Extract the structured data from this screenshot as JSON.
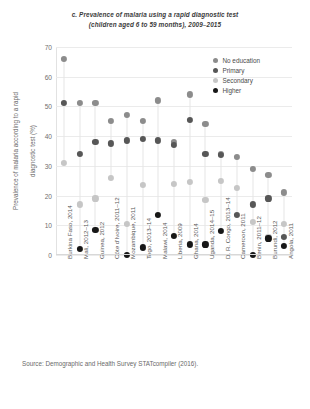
{
  "chart_data": {
    "type": "scatter",
    "title": "c. Prevalence of malaria using a rapid diagnostic test",
    "subtitle": "(children aged 6 to 59 months), 2009–2015",
    "xlabel": "",
    "ylabel": "Prevalence of malaria according to a rapid",
    "ylabel_line2": "diagnostic test (%)",
    "ylim": [
      0,
      70
    ],
    "yticks": [
      0,
      10,
      20,
      30,
      40,
      50,
      60,
      70
    ],
    "grid": true,
    "legend_position": "top-right",
    "categories": [
      "Burkina Faso, 2014",
      "Mali, 2012–13",
      "Guinea, 2012",
      "Côte d'Ivoire, 2011–12",
      "Mozambique, 2011",
      "Togo, 2013–14",
      "Malawi, 2014",
      "Liberia, 2009",
      "Ghana, 2014",
      "Uganda, 2014–15",
      "D. R. Congo, 2013–14",
      "Cameroon, 2011",
      "Benin, 2011–12",
      "Burundi, 2012",
      "Angola, 2011"
    ],
    "series": [
      {
        "name": "No education",
        "color": "#8c8c8c",
        "values": [
          66,
          51,
          51,
          45,
          47,
          45,
          52,
          38,
          54,
          44,
          34,
          33,
          29,
          27,
          21
        ]
      },
      {
        "name": "Primary",
        "color": "#575757",
        "values": [
          51,
          34,
          38,
          37.5,
          38.5,
          39,
          38.5,
          37,
          45.5,
          34,
          33.5,
          13.5,
          17,
          19,
          6
        ]
      },
      {
        "name": "Secondary",
        "color": "#c6c6c6",
        "values": [
          31,
          17,
          19,
          26,
          10.5,
          23.5,
          null,
          24,
          24.5,
          18.5,
          25,
          22.5,
          11,
          6,
          10.5
        ]
      },
      {
        "name": "Higher",
        "color": "#171717",
        "values": [
          null,
          2,
          8.5,
          null,
          0,
          2.5,
          13.5,
          6.5,
          3.5,
          3.5,
          8,
          null,
          0,
          5.5,
          3
        ]
      }
    ]
  },
  "legend": {
    "items": [
      {
        "label": "No education",
        "color": "#8c8c8c"
      },
      {
        "label": "Primary",
        "color": "#575757"
      },
      {
        "label": "Secondary",
        "color": "#c6c6c6"
      },
      {
        "label": "Higher",
        "color": "#171717"
      }
    ]
  },
  "source": {
    "text": "Source: Demographic and Health Survey STATcompiler (2016)."
  }
}
